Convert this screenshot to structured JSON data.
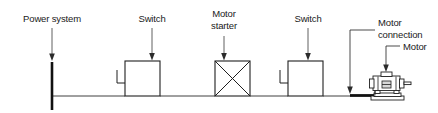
{
  "diagram": {
    "type": "electrical-single-line",
    "background_color": "#ffffff",
    "line_color": "#1f1f1f",
    "text_color": "#1a1a1a",
    "labels": {
      "power_system": "Power system",
      "switch_1": "Switch",
      "motor_starter_line1": "Motor",
      "motor_starter_line2": "starter",
      "switch_2": "Switch",
      "motor_connection_line1": "Motor",
      "motor_connection_line2": "connection",
      "motor": "Motor"
    },
    "components": [
      {
        "id": "power-system",
        "label": "Power system",
        "symbol": "vertical-bus-bar"
      },
      {
        "id": "switch-1",
        "label": "Switch",
        "symbol": "square-with-contact"
      },
      {
        "id": "motor-starter",
        "label": "Motor starter",
        "symbol": "square-with-cross"
      },
      {
        "id": "switch-2",
        "label": "Switch",
        "symbol": "square-with-contact"
      },
      {
        "id": "motor-connection",
        "label": "Motor connection",
        "symbol": "thick-cable-segment"
      },
      {
        "id": "motor",
        "label": "Motor",
        "symbol": "pictorial-motor"
      }
    ]
  }
}
